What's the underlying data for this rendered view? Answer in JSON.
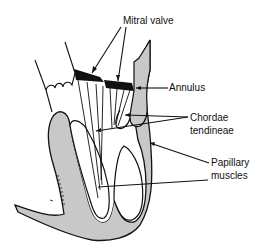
{
  "diagram": {
    "type": "anatomical-illustration",
    "labels": {
      "mitral_valve": "Mitral valve",
      "annulus": "Annulus",
      "chordae_line1": "Chordae",
      "chordae_line2": "tendineae",
      "papillary_line1": "Papillary",
      "papillary_line2": "muscles"
    },
    "colors": {
      "tissue_fill": "#c8c8c8",
      "outline": "#111111",
      "valve_leaflet": "#111111",
      "background": "#ffffff"
    }
  }
}
